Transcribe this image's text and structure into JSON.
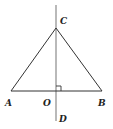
{
  "diagram": {
    "type": "geometry",
    "stroke_color": "#333333",
    "axis_color": "#888888",
    "points": {
      "A": {
        "label": "A",
        "x": 11,
        "y": 91
      },
      "B": {
        "label": "B",
        "x": 102,
        "y": 91
      },
      "C": {
        "label": "C",
        "x": 56,
        "y": 28
      },
      "O": {
        "label": "O",
        "x": 56,
        "y": 91
      },
      "D": {
        "label": "D",
        "x": 56,
        "y": 118
      }
    },
    "segments": [
      "AB",
      "AC",
      "BC",
      "CD"
    ],
    "right_angle_at": "O"
  }
}
